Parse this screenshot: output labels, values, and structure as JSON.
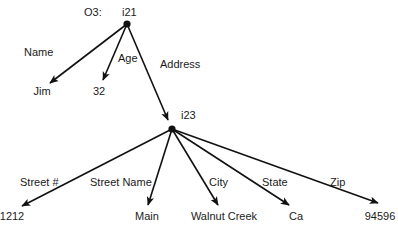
{
  "diagram": {
    "object_label": "O3:",
    "colors": {
      "ink": "#111111",
      "background": "#ffffff"
    },
    "nodes": [
      {
        "id": "i21",
        "label": "i21",
        "x": 127,
        "y": 24,
        "type": "object"
      },
      {
        "id": "i23",
        "label": "i23",
        "x": 172,
        "y": 129,
        "type": "object"
      },
      {
        "id": "jim",
        "label": "Jim",
        "x": 42,
        "y": 95,
        "type": "value"
      },
      {
        "id": "v32",
        "label": "32",
        "x": 99,
        "y": 95,
        "type": "value"
      },
      {
        "id": "v1212",
        "label": "1212",
        "x": 12,
        "y": 220,
        "type": "value"
      },
      {
        "id": "main",
        "label": "Main",
        "x": 147,
        "y": 220,
        "type": "value"
      },
      {
        "id": "walnut",
        "label": "Walnut Creek",
        "x": 224,
        "y": 220,
        "type": "value"
      },
      {
        "id": "ca",
        "label": "Ca",
        "x": 296,
        "y": 220,
        "type": "value"
      },
      {
        "id": "zip",
        "label": "94596",
        "x": 380,
        "y": 220,
        "type": "value"
      }
    ],
    "edges": [
      {
        "from": "i21",
        "to": "jim",
        "label": "Name",
        "x2": 50,
        "y2": 83,
        "lx": 24,
        "ly": 56
      },
      {
        "from": "i21",
        "to": "v32",
        "label": "Age",
        "x2": 103,
        "y2": 80,
        "lx": 118,
        "ly": 62
      },
      {
        "from": "i21",
        "to": "i23",
        "label": "Address",
        "x2": 168,
        "y2": 120,
        "lx": 160,
        "ly": 68
      },
      {
        "from": "i23",
        "to": "v1212",
        "label": "Street #",
        "x2": 22,
        "y2": 206,
        "lx": 20,
        "ly": 186
      },
      {
        "from": "i23",
        "to": "main",
        "label": "Street Name",
        "x2": 148,
        "y2": 205,
        "lx": 90,
        "ly": 186
      },
      {
        "from": "i23",
        "to": "walnut",
        "label": "City",
        "x2": 218,
        "y2": 205,
        "lx": 209,
        "ly": 186
      },
      {
        "from": "i23",
        "to": "ca",
        "label": "State",
        "x2": 289,
        "y2": 205,
        "lx": 262,
        "ly": 186
      },
      {
        "from": "i23",
        "to": "zip",
        "label": "Zip",
        "x2": 378,
        "y2": 203,
        "lx": 330,
        "ly": 186
      }
    ]
  }
}
